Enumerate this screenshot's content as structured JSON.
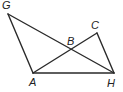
{
  "figure": {
    "type": "geometry",
    "points": {
      "G": {
        "label": "G",
        "x": 8,
        "y": 14,
        "lx": 2,
        "ly": 9
      },
      "A": {
        "label": "A",
        "x": 33,
        "y": 73,
        "lx": 30,
        "ly": 86
      },
      "H": {
        "label": "H",
        "x": 114,
        "y": 73,
        "lx": 108,
        "ly": 87
      },
      "C": {
        "label": "C",
        "x": 97,
        "y": 33,
        "lx": 91,
        "ly": 30
      },
      "B": {
        "label": "B",
        "x": 71,
        "y": 50,
        "lx": 67,
        "ly": 45
      }
    },
    "segments": [
      [
        "G",
        "A"
      ],
      [
        "G",
        "H"
      ],
      [
        "A",
        "H"
      ],
      [
        "A",
        "C"
      ],
      [
        "C",
        "H"
      ]
    ],
    "labels": [
      "G",
      "A",
      "H",
      "C",
      "B"
    ],
    "stroke_color": "#2a2a2a"
  }
}
